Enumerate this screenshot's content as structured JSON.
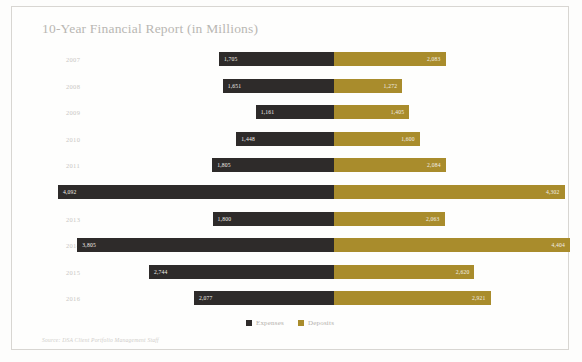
{
  "chart_title": "10-Year Financial Report (in Millions)",
  "source_note": "Source: DSA Client Portfolio Management Staff",
  "legend": {
    "expenses_label": "Expenses",
    "deposits_label": "Deposits",
    "expenses_color": "#2e2b2a",
    "deposits_color": "#a98c2c"
  },
  "chart_data": {
    "type": "bar",
    "subtype": "diverging-butterfly",
    "title": "10-Year Financial Report (in Millions)",
    "xlabel": "",
    "ylabel": "",
    "grid": false,
    "legend_position": "bottom-center",
    "orientation": "horizontal",
    "categories": [
      "2007",
      "2008",
      "2009",
      "2010",
      "2011",
      "2012",
      "2013",
      "2014",
      "2015",
      "2016"
    ],
    "series": [
      {
        "name": "Expenses",
        "color": "#2e2b2a",
        "side": "left",
        "values": [
          1705,
          1651,
          1161,
          1448,
          1805,
          4092,
          1800,
          3805,
          2744,
          2077
        ],
        "labels": [
          "1,705",
          "1,651",
          "1,161",
          "1,448",
          "1,805",
          "4,092",
          "1,800",
          "3,805",
          "2,744",
          "2,077"
        ]
      },
      {
        "name": "Deposits",
        "color": "#a98c2c",
        "side": "right",
        "values": [
          2083,
          1272,
          1405,
          1600,
          2084,
          4302,
          2063,
          4404,
          2620,
          2921
        ],
        "labels": [
          "2,083",
          "1,272",
          "1,405",
          "1,600",
          "2,084",
          "4,302",
          "2,063",
          "4,404",
          "2,620",
          "2,921"
        ]
      }
    ],
    "axis_max_left": 4092,
    "axis_max_right": 4404
  }
}
